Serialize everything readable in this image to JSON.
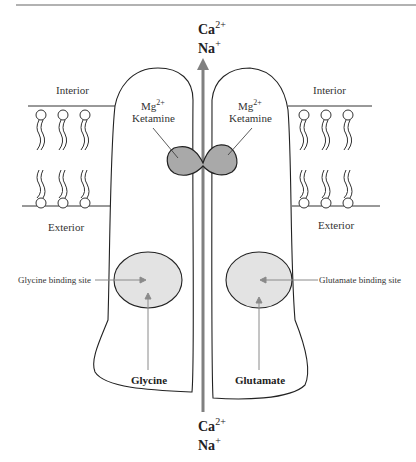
{
  "diagram": {
    "ions_top": {
      "ca": "Ca",
      "ca_sup": "2+",
      "na": "Na",
      "na_sup": "+"
    },
    "ions_bottom": {
      "ca": "Ca",
      "ca_sup": "2+",
      "na": "Na",
      "na_sup": "+"
    },
    "interior_left": "Interior",
    "interior_right": "Interior",
    "exterior_left": "Exterior",
    "exterior_right": "Exterior",
    "blocker_left": {
      "mg": "Mg",
      "mg_sup": "2+",
      "ketamine": "Ketamine"
    },
    "blocker_right": {
      "mg": "Mg",
      "mg_sup": "2+",
      "ketamine": "Ketamine"
    },
    "glycine_site_label": "Glycine binding site",
    "glutamate_site_label": "Glutamate binding site",
    "glycine_label": "Glycine",
    "glutamate_label": "Glutamate",
    "colors": {
      "outline": "#222222",
      "blocker_fill": "#a9a9a9",
      "site_fill": "#e3e3e3",
      "arrow": "#808080",
      "pointer": "#8a8a8a"
    }
  }
}
